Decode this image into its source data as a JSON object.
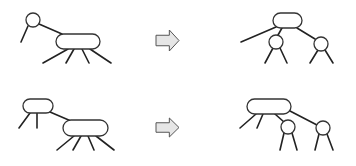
{
  "diagram": {
    "title": "",
    "colors": {
      "stroke": "#222222",
      "node_fill": "#ffffff",
      "arrow_fill": "#e6e6e6",
      "arrow_stroke": "#555555",
      "background": "#ffffff"
    },
    "rows": [
      {
        "id": "top",
        "before": {
          "nodes": [
            {
              "id": "t1-circle",
              "shape": "circle",
              "cx": 33,
              "cy": 20,
              "r": 7
            },
            {
              "id": "t1-capsule",
              "shape": "capsule",
              "x": 56,
              "y": 34,
              "w": 44,
              "h": 15
            }
          ],
          "edges": [
            [
              28,
              26,
              21,
              42
            ],
            [
              39,
              24,
              62,
              34
            ],
            [
              68,
              49,
              43,
              63
            ],
            [
              74,
              49,
              66,
              63
            ],
            [
              82,
              49,
              89,
              63
            ],
            [
              90,
              49,
              111,
              63
            ]
          ]
        },
        "arrow": {
          "x": 156,
          "y": 30,
          "w": 23,
          "h": 21
        },
        "after": {
          "nodes": [
            {
              "id": "t2-capsule",
              "shape": "capsule",
              "x": 273,
              "y": 13,
              "w": 29,
              "h": 15
            },
            {
              "id": "t2-circle-left",
              "shape": "circle",
              "cx": 276,
              "cy": 42,
              "r": 7
            },
            {
              "id": "t2-circle-right",
              "shape": "circle",
              "cx": 321,
              "cy": 44,
              "r": 7
            }
          ],
          "edges": [
            [
              276,
              27,
              241,
              42
            ],
            [
              282,
              28,
              278,
              35
            ],
            [
              297,
              28,
              315,
              39
            ],
            [
              273,
              48,
              265,
              63
            ],
            [
              280,
              48,
              287,
              63
            ],
            [
              318,
              50,
              310,
              63
            ],
            [
              325,
              50,
              333,
              63
            ]
          ]
        }
      },
      {
        "id": "bottom",
        "before": {
          "nodes": [
            {
              "id": "b1-capsule-small",
              "shape": "capsule",
              "x": 23,
              "y": 99,
              "w": 30,
              "h": 14
            },
            {
              "id": "b1-capsule-big",
              "shape": "capsule",
              "x": 63,
              "y": 120,
              "w": 45,
              "h": 16
            }
          ],
          "edges": [
            [
              30,
              113,
              19,
              128
            ],
            [
              37,
              113,
              37,
              128
            ],
            [
              50,
              112,
              71,
              121
            ],
            [
              74,
              136,
              57,
              150
            ],
            [
              81,
              136,
              73,
              150
            ],
            [
              88,
              136,
              94,
              150
            ],
            [
              96,
              136,
              114,
              150
            ]
          ]
        },
        "arrow": {
          "x": 156,
          "y": 118,
          "w": 23,
          "h": 19
        },
        "after": {
          "nodes": [
            {
              "id": "b2-capsule",
              "shape": "capsule",
              "x": 247,
              "y": 99,
              "w": 44,
              "h": 15
            },
            {
              "id": "b2-circle-left",
              "shape": "circle",
              "cx": 288,
              "cy": 127,
              "r": 7
            },
            {
              "id": "b2-circle-right",
              "shape": "circle",
              "cx": 323,
              "cy": 128,
              "r": 7
            }
          ],
          "edges": [
            [
              256,
              114,
              240,
              128
            ],
            [
              263,
              114,
              257,
              128
            ],
            [
              275,
              114,
              284,
              122
            ],
            [
              290,
              111,
              317,
              125
            ],
            [
              284,
              133,
              280,
              150
            ],
            [
              292,
              133,
              297,
              150
            ],
            [
              319,
              134,
              315,
              150
            ],
            [
              327,
              134,
              333,
              150
            ]
          ]
        }
      }
    ]
  }
}
